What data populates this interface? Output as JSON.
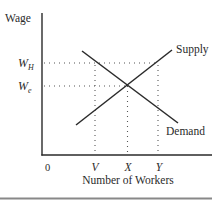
{
  "diagram": {
    "type": "supply-demand",
    "y_axis_label": "Wage",
    "x_axis_label": "Number of Workers",
    "origin_label": "0",
    "wage_levels": [
      {
        "id": "high",
        "label": "W",
        "subscript": "H"
      },
      {
        "id": "equilibrium",
        "label": "W",
        "subscript": "e"
      }
    ],
    "quantity_levels": [
      {
        "id": "v",
        "label": "V"
      },
      {
        "id": "x",
        "label": "X"
      },
      {
        "id": "y",
        "label": "Y"
      }
    ],
    "curves": [
      {
        "id": "supply",
        "label": "Supply",
        "slope": "upward"
      },
      {
        "id": "demand",
        "label": "Demand",
        "slope": "downward"
      }
    ],
    "colors": {
      "line": "#2a2a2a",
      "guide": "#555555",
      "rule": "#888888",
      "background": "#ffffff"
    }
  }
}
